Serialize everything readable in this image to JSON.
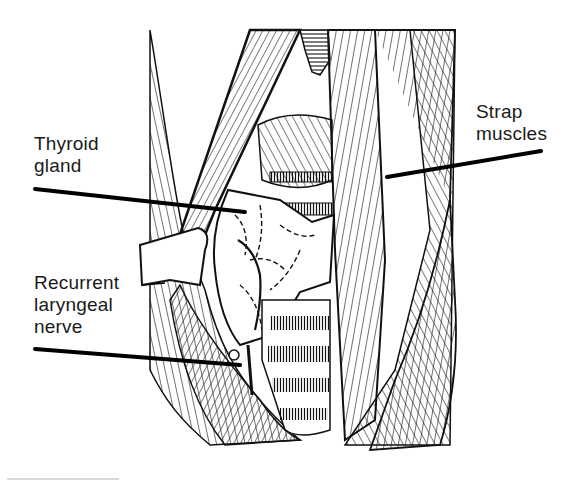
{
  "figure": {
    "type": "anatomical line illustration",
    "colors": {
      "ink": "#111111",
      "background": "#ffffff"
    }
  },
  "labels": {
    "thyroid": {
      "line1": "Thyroid",
      "line2": "gland"
    },
    "strap": {
      "line1": "Strap",
      "line2": "muscles"
    },
    "nerve": {
      "line1": "Recurrent",
      "line2": "laryngeal",
      "line3": "nerve"
    }
  }
}
